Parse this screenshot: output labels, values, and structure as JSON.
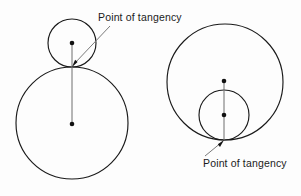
{
  "figure": {
    "name": "tangent-circles-diagram",
    "background_color": "#fdfdfd",
    "stroke_color": "#1a1a1a",
    "leader_color": "#7a7a7a",
    "width": 301,
    "height": 196,
    "labels": {
      "top": "Point of tangency",
      "bottom": "Point of tangency"
    },
    "left_diagram": {
      "title": "externally-tangent-circles",
      "small_circle": {
        "cx": 72,
        "cy": 43,
        "r": 24
      },
      "large_circle": {
        "cx": 72,
        "cy": 123,
        "r": 56
      },
      "tangency_point": {
        "x": 72,
        "y": 67
      },
      "small_center_dot": {
        "x": 72,
        "y": 43
      },
      "large_center_dot": {
        "x": 72,
        "y": 124
      },
      "radius_line": {
        "x1": 72,
        "y1": 43,
        "x2": 72,
        "y2": 124
      },
      "leader_line": {
        "x1": 110,
        "y1": 26,
        "x2": 74,
        "y2": 64
      }
    },
    "right_diagram": {
      "title": "internally-tangent-circles",
      "large_circle": {
        "cx": 225,
        "cy": 82,
        "r": 58
      },
      "small_circle": {
        "cx": 224,
        "cy": 115,
        "r": 25
      },
      "tangency_point": {
        "x": 224,
        "y": 140
      },
      "large_center_dot": {
        "x": 224,
        "y": 81
      },
      "small_center_dot": {
        "x": 224,
        "y": 115
      },
      "radius_line": {
        "x1": 224,
        "y1": 81,
        "x2": 224,
        "y2": 140
      },
      "leader_line": {
        "x1": 205,
        "y1": 156,
        "x2": 222,
        "y2": 142
      }
    }
  }
}
